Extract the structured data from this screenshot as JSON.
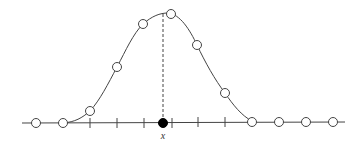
{
  "diagram": {
    "colors": {
      "stroke": "#444444",
      "point_fill": "#ffffff",
      "marked_point_fill": "#000000",
      "background": "#ffffff"
    },
    "axis": {
      "y": 123,
      "x_start": 22,
      "x_end": 345,
      "ticks_x": [
        90,
        117,
        144,
        172,
        198,
        225
      ]
    },
    "curve_points": [
      {
        "x": 90,
        "y": 111
      },
      {
        "x": 117,
        "y": 67
      },
      {
        "x": 143,
        "y": 24
      },
      {
        "x": 171,
        "y": 14
      },
      {
        "x": 197,
        "y": 45
      },
      {
        "x": 225,
        "y": 93
      }
    ],
    "axis_points": [
      {
        "x": 36,
        "y": 123
      },
      {
        "x": 63,
        "y": 123
      },
      {
        "x": 252,
        "y": 122
      },
      {
        "x": 279,
        "y": 122
      },
      {
        "x": 306,
        "y": 122
      },
      {
        "x": 333,
        "y": 122
      }
    ],
    "marked_point": {
      "x": 163,
      "y": 123,
      "label": "x"
    },
    "dashed_line": {
      "x": 163,
      "y_top": 14,
      "y_bottom": 123
    }
  }
}
